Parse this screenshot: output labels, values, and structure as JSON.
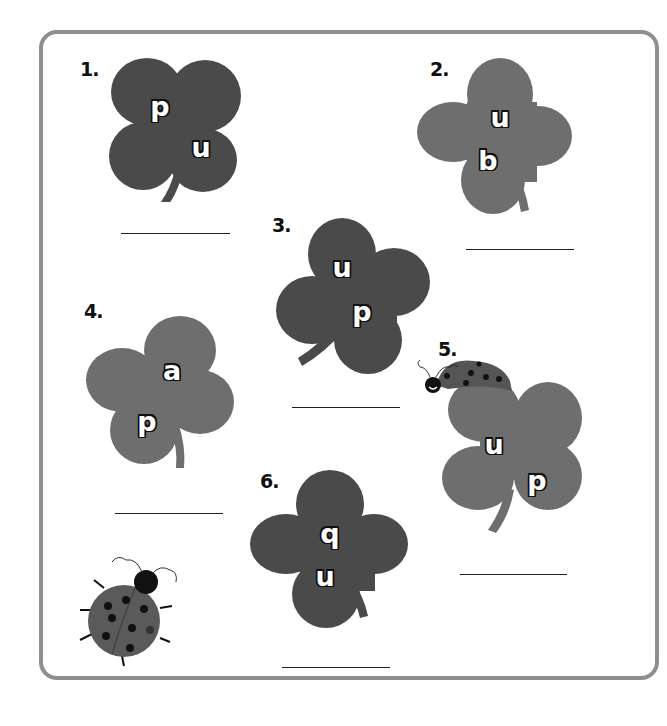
{
  "worksheet": {
    "theme": "clover letter puzzles",
    "colors": {
      "frame_border": "#8e8e8e",
      "clover_dark": "#4a4a4a",
      "clover_medium": "#6e6e6e",
      "letter_fill": "#ffffff",
      "letter_outline": "#111111",
      "answer_line": "#222222"
    },
    "items": [
      {
        "number": "1.",
        "letters": [
          "p",
          "u"
        ],
        "shade": "dark"
      },
      {
        "number": "2.",
        "letters": [
          "u",
          "b"
        ],
        "shade": "medium"
      },
      {
        "number": "3.",
        "letters": [
          "u",
          "p"
        ],
        "shade": "dark"
      },
      {
        "number": "4.",
        "letters": [
          "a",
          "p"
        ],
        "shade": "medium"
      },
      {
        "number": "5.",
        "letters": [
          "u",
          "p"
        ],
        "shade": "medium"
      },
      {
        "number": "6.",
        "letters": [
          "q",
          "u"
        ],
        "shade": "dark"
      }
    ],
    "decorations": [
      "ladybug-on-clover-5",
      "ladybug-bottom-left"
    ]
  }
}
